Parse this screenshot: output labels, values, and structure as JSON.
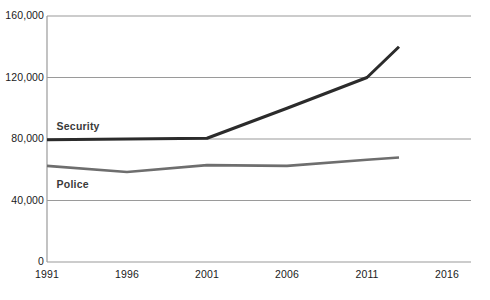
{
  "chart_data": {
    "type": "line",
    "title": "",
    "xlabel": "",
    "ylabel": "",
    "x": [
      1991,
      1996,
      2001,
      2006,
      2011,
      2013
    ],
    "categories": [
      "1991",
      "1996",
      "2001",
      "2006",
      "2011",
      "2016"
    ],
    "xlim": [
      1991,
      2017.5
    ],
    "ylim": [
      0,
      160000
    ],
    "grid": true,
    "legend_position": "inline-labels",
    "series": [
      {
        "name": "Security",
        "color": "#2b2b2b",
        "values": [
          79500,
          80000,
          80500,
          100000,
          120000,
          140000
        ]
      },
      {
        "name": "Police",
        "color": "#6e6e6e",
        "values": [
          62500,
          58500,
          63000,
          62500,
          66500,
          68000
        ]
      }
    ],
    "yticks": [
      {
        "value": 0,
        "label": "0"
      },
      {
        "value": 40000,
        "label": "40,000"
      },
      {
        "value": 80000,
        "label": "80,000"
      },
      {
        "value": 120000,
        "label": "120,000"
      },
      {
        "value": 160000,
        "label": "160,000"
      }
    ],
    "xticks": [
      {
        "value": 1991,
        "label": "1991"
      },
      {
        "value": 1996,
        "label": "1996"
      },
      {
        "value": 2001,
        "label": "2001"
      },
      {
        "value": 2006,
        "label": "2006"
      },
      {
        "value": 2011,
        "label": "2011"
      },
      {
        "value": 2016,
        "label": "2016"
      }
    ],
    "annotations": [
      {
        "text": "Security",
        "x": 1991.6,
        "y": 88000
      },
      {
        "text": "Police",
        "x": 1991.6,
        "y": 50000
      }
    ]
  },
  "axes": {
    "y_axis_name": "value-axis",
    "x_axis_name": "year-axis"
  }
}
